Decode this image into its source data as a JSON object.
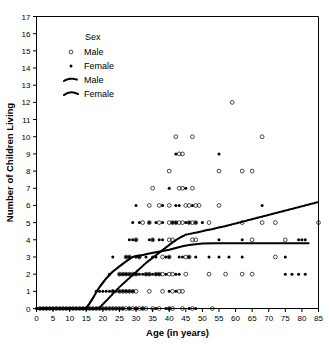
{
  "chart_data": {
    "type": "scatter",
    "title": "",
    "xlabel": "Age (in years)",
    "ylabel": "Number of Children Living",
    "xlim": [
      0,
      85
    ],
    "ylim": [
      0,
      17
    ],
    "xticks": [
      0,
      5,
      10,
      15,
      20,
      25,
      30,
      35,
      40,
      45,
      50,
      55,
      60,
      65,
      70,
      75,
      80,
      85
    ],
    "yticks": [
      0,
      1,
      2,
      3,
      4,
      5,
      6,
      7,
      8,
      9,
      10,
      11,
      12,
      13,
      14,
      15,
      16,
      17
    ],
    "grid": false,
    "legend": {
      "position": "upper-left-inside",
      "title": "Sex",
      "entries": [
        {
          "label": "Male",
          "marker": "open-circle",
          "kind": "points"
        },
        {
          "label": "Female",
          "marker": "filled-circle",
          "kind": "points"
        },
        {
          "label": "Male",
          "marker": "dashed-line",
          "kind": "line"
        },
        {
          "label": "Female",
          "marker": "solid-line",
          "kind": "line"
        }
      ]
    },
    "series": [
      {
        "name": "Male",
        "marker": "open-circle",
        "points": [
          [
            1,
            0
          ],
          [
            2,
            0
          ],
          [
            3,
            0
          ],
          [
            4,
            0
          ],
          [
            5,
            0
          ],
          [
            6,
            0
          ],
          [
            7,
            0
          ],
          [
            8,
            0
          ],
          [
            9,
            0
          ],
          [
            10,
            0
          ],
          [
            11,
            0
          ],
          [
            12,
            0
          ],
          [
            13,
            0
          ],
          [
            14,
            0
          ],
          [
            15,
            0
          ],
          [
            16,
            0
          ],
          [
            17,
            0
          ],
          [
            18,
            0
          ],
          [
            19,
            0
          ],
          [
            20,
            0
          ],
          [
            21,
            0
          ],
          [
            22,
            0
          ],
          [
            23,
            0
          ],
          [
            24,
            0
          ],
          [
            25,
            0
          ],
          [
            26,
            0
          ],
          [
            27,
            0
          ],
          [
            28,
            0
          ],
          [
            29,
            0
          ],
          [
            30,
            0
          ],
          [
            31,
            0
          ],
          [
            32,
            0
          ],
          [
            33,
            0
          ],
          [
            35,
            0
          ],
          [
            37,
            0
          ],
          [
            40,
            0
          ],
          [
            41,
            0
          ],
          [
            44,
            0
          ],
          [
            47,
            0
          ],
          [
            53,
            0
          ],
          [
            23,
            1
          ],
          [
            25,
            1
          ],
          [
            26,
            1
          ],
          [
            27,
            1
          ],
          [
            28,
            1
          ],
          [
            29,
            1
          ],
          [
            30,
            1
          ],
          [
            34,
            1
          ],
          [
            38,
            1
          ],
          [
            41,
            1
          ],
          [
            43,
            1
          ],
          [
            44,
            1
          ],
          [
            25,
            2
          ],
          [
            26,
            2
          ],
          [
            27,
            2
          ],
          [
            28,
            2
          ],
          [
            29,
            2
          ],
          [
            30,
            2
          ],
          [
            33,
            2
          ],
          [
            34,
            2
          ],
          [
            36,
            2
          ],
          [
            37,
            2
          ],
          [
            38,
            2
          ],
          [
            40,
            2
          ],
          [
            41,
            2
          ],
          [
            45,
            2
          ],
          [
            52,
            2
          ],
          [
            57,
            2
          ],
          [
            62,
            2
          ],
          [
            65,
            2
          ],
          [
            27,
            3
          ],
          [
            28,
            3
          ],
          [
            31,
            3
          ],
          [
            38,
            3
          ],
          [
            40,
            3
          ],
          [
            45,
            3
          ],
          [
            46,
            3
          ],
          [
            72,
            3
          ],
          [
            30,
            4
          ],
          [
            35,
            4
          ],
          [
            40,
            4
          ],
          [
            41,
            4
          ],
          [
            47,
            4
          ],
          [
            48,
            4
          ],
          [
            65,
            4
          ],
          [
            75,
            4
          ],
          [
            32,
            5
          ],
          [
            34,
            5
          ],
          [
            37,
            5
          ],
          [
            40,
            5
          ],
          [
            41,
            5
          ],
          [
            42,
            5
          ],
          [
            43,
            5
          ],
          [
            44,
            5
          ],
          [
            46,
            5
          ],
          [
            47,
            5
          ],
          [
            48,
            5
          ],
          [
            52,
            5
          ],
          [
            62,
            5
          ],
          [
            68,
            5
          ],
          [
            72,
            5
          ],
          [
            85,
            5
          ],
          [
            34,
            6
          ],
          [
            37,
            6
          ],
          [
            40,
            6
          ],
          [
            45,
            6
          ],
          [
            46,
            6
          ],
          [
            48,
            6
          ],
          [
            49,
            6
          ],
          [
            55,
            6
          ],
          [
            35,
            7
          ],
          [
            43,
            7
          ],
          [
            44,
            7
          ],
          [
            47,
            7
          ],
          [
            40,
            8
          ],
          [
            55,
            8
          ],
          [
            62,
            8
          ],
          [
            65,
            8
          ],
          [
            43,
            9
          ],
          [
            44,
            9
          ],
          [
            42,
            10
          ],
          [
            47,
            10
          ],
          [
            68,
            10
          ],
          [
            59,
            12
          ]
        ]
      },
      {
        "name": "Female",
        "marker": "filled-circle",
        "points": [
          [
            0,
            0
          ],
          [
            1,
            0
          ],
          [
            2,
            0
          ],
          [
            3,
            0
          ],
          [
            4,
            0
          ],
          [
            5,
            0
          ],
          [
            6,
            0
          ],
          [
            7,
            0
          ],
          [
            8,
            0
          ],
          [
            9,
            0
          ],
          [
            10,
            0
          ],
          [
            11,
            0
          ],
          [
            12,
            0
          ],
          [
            13,
            0
          ],
          [
            14,
            0
          ],
          [
            15,
            0
          ],
          [
            16,
            0
          ],
          [
            17,
            0
          ],
          [
            18,
            0
          ],
          [
            19,
            0
          ],
          [
            20,
            0
          ],
          [
            21,
            0
          ],
          [
            22,
            0
          ],
          [
            23,
            0
          ],
          [
            24,
            0
          ],
          [
            25,
            0
          ],
          [
            26,
            0
          ],
          [
            28,
            0
          ],
          [
            30,
            0
          ],
          [
            32,
            0
          ],
          [
            36,
            0
          ],
          [
            39,
            0
          ],
          [
            40,
            0
          ],
          [
            46,
            0
          ],
          [
            48,
            0
          ],
          [
            18,
            1
          ],
          [
            19,
            1
          ],
          [
            20,
            1
          ],
          [
            21,
            1
          ],
          [
            22,
            1
          ],
          [
            23,
            1
          ],
          [
            24,
            1
          ],
          [
            25,
            1
          ],
          [
            26,
            1
          ],
          [
            27,
            1
          ],
          [
            28,
            1
          ],
          [
            29,
            1
          ],
          [
            40,
            1
          ],
          [
            42,
            1
          ],
          [
            22,
            2
          ],
          [
            25,
            2
          ],
          [
            26,
            2
          ],
          [
            27,
            2
          ],
          [
            28,
            2
          ],
          [
            29,
            2
          ],
          [
            30,
            2
          ],
          [
            31,
            2
          ],
          [
            32,
            2
          ],
          [
            33,
            2
          ],
          [
            34,
            2
          ],
          [
            35,
            2
          ],
          [
            36,
            2
          ],
          [
            37,
            2
          ],
          [
            39,
            2
          ],
          [
            42,
            2
          ],
          [
            43,
            2
          ],
          [
            75,
            2
          ],
          [
            77,
            2
          ],
          [
            79,
            2
          ],
          [
            81,
            2
          ],
          [
            23,
            3
          ],
          [
            27,
            3
          ],
          [
            28,
            3
          ],
          [
            30,
            3
          ],
          [
            31,
            3
          ],
          [
            33,
            3
          ],
          [
            35,
            3
          ],
          [
            36,
            3
          ],
          [
            39,
            3
          ],
          [
            40,
            3
          ],
          [
            43,
            3
          ],
          [
            44,
            3
          ],
          [
            46,
            3
          ],
          [
            48,
            3
          ],
          [
            52,
            3
          ],
          [
            55,
            3
          ],
          [
            58,
            3
          ],
          [
            62,
            3
          ],
          [
            75,
            3
          ],
          [
            28,
            4
          ],
          [
            29,
            4
          ],
          [
            30,
            4
          ],
          [
            34,
            4
          ],
          [
            35,
            4
          ],
          [
            37,
            4
          ],
          [
            38,
            4
          ],
          [
            55,
            4
          ],
          [
            62,
            4
          ],
          [
            79,
            4
          ],
          [
            80,
            4
          ],
          [
            81,
            4
          ],
          [
            29,
            5
          ],
          [
            31,
            5
          ],
          [
            34,
            5
          ],
          [
            36,
            5
          ],
          [
            38,
            5
          ],
          [
            41,
            5
          ],
          [
            42,
            5
          ],
          [
            45,
            5
          ],
          [
            46,
            5
          ],
          [
            48,
            5
          ],
          [
            50,
            5
          ],
          [
            30,
            6
          ],
          [
            38,
            6
          ],
          [
            42,
            6
          ],
          [
            43,
            6
          ],
          [
            47,
            6
          ],
          [
            68,
            6
          ],
          [
            40,
            7
          ],
          [
            45,
            7
          ],
          [
            42,
            9
          ],
          [
            55,
            9
          ]
        ]
      }
    ],
    "fits": [
      {
        "name": "Male",
        "style": "dashed",
        "points": [
          [
            0,
            0
          ],
          [
            15,
            0
          ],
          [
            18,
            0
          ],
          [
            19,
            0.05
          ],
          [
            21,
            0.45
          ],
          [
            23,
            0.85
          ],
          [
            25,
            1.25
          ],
          [
            27,
            1.6
          ],
          [
            29,
            1.95
          ],
          [
            31,
            2.3
          ],
          [
            33,
            2.65
          ],
          [
            35,
            2.95
          ],
          [
            37,
            3.25
          ],
          [
            39,
            3.55
          ],
          [
            41,
            3.85
          ],
          [
            43,
            4.1
          ],
          [
            45,
            4.3
          ],
          [
            47,
            4.38
          ],
          [
            49,
            4.45
          ],
          [
            51,
            4.55
          ],
          [
            53,
            4.62
          ],
          [
            55,
            4.72
          ],
          [
            57,
            4.8
          ],
          [
            59,
            4.9
          ],
          [
            61,
            5.0
          ],
          [
            63,
            5.1
          ],
          [
            65,
            5.2
          ],
          [
            67,
            5.3
          ],
          [
            69,
            5.4
          ],
          [
            71,
            5.5
          ],
          [
            73,
            5.6
          ],
          [
            75,
            5.7
          ],
          [
            77,
            5.8
          ],
          [
            79,
            5.9
          ],
          [
            81,
            6.0
          ],
          [
            83,
            6.1
          ],
          [
            85,
            6.2
          ]
        ]
      },
      {
        "name": "Female",
        "style": "solid",
        "points": [
          [
            0,
            0
          ],
          [
            14,
            0
          ],
          [
            15,
            0.02
          ],
          [
            16,
            0.3
          ],
          [
            17,
            0.6
          ],
          [
            18,
            0.95
          ],
          [
            19,
            1.25
          ],
          [
            20,
            1.5
          ],
          [
            21,
            1.75
          ],
          [
            22,
            1.95
          ],
          [
            23,
            2.15
          ],
          [
            24,
            2.3
          ],
          [
            25,
            2.45
          ],
          [
            26,
            2.6
          ],
          [
            27,
            2.75
          ],
          [
            28,
            2.88
          ],
          [
            29,
            3.0
          ],
          [
            30,
            3.05
          ],
          [
            32,
            3.12
          ],
          [
            34,
            3.2
          ],
          [
            36,
            3.28
          ],
          [
            38,
            3.35
          ],
          [
            40,
            3.42
          ],
          [
            42,
            3.52
          ],
          [
            44,
            3.62
          ],
          [
            46,
            3.7
          ],
          [
            48,
            3.74
          ],
          [
            50,
            3.78
          ],
          [
            54,
            3.8
          ],
          [
            58,
            3.8
          ],
          [
            62,
            3.8
          ],
          [
            66,
            3.8
          ],
          [
            70,
            3.8
          ],
          [
            74,
            3.8
          ],
          [
            78,
            3.8
          ],
          [
            82,
            3.8
          ]
        ]
      }
    ]
  }
}
